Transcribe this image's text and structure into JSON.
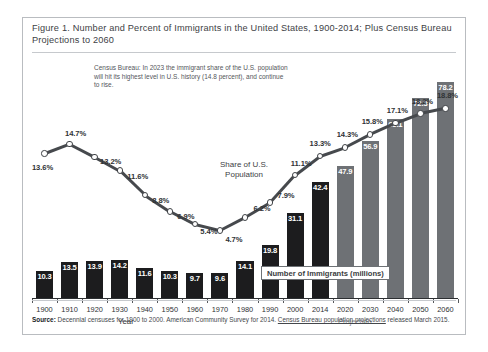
{
  "figure": {
    "title": "Figure 1. Number and Percent of Immigrants in the United States, 1900-2014; Plus Census Bureau Projections to 2060",
    "annotation": "Census Bureau: In 2023 the immigrant share of the U.S. population will hit its highest level in U.S. history (14.8 percent), and continue to rise.",
    "share_label": "Share of U.S. Population",
    "legend_label": "Number of Immigrants (millions)",
    "axis_title": "Year",
    "projection_title": "Projection",
    "source_prefix": "Source:",
    "source_text": " Decennial censuses for 1900 to 2000. American Community Survey for 2014. ",
    "source_link": "Census Bureau population projections",
    "source_suffix": " released March 2015."
  },
  "colors": {
    "historical_bar": "#1c1c1e",
    "projection_bar": "#6e7175",
    "line": "#46494d",
    "frame": "#b9bcc0"
  },
  "chart_data": {
    "type": "bar",
    "title": "Figure 1. Number and Percent of Immigrants in the United States, 1900-2014; Plus Census Bureau Projections to 2060",
    "xlabel": "Year",
    "ylabel": "Number of Immigrants (millions)",
    "ylim": [
      0,
      85
    ],
    "grid": false,
    "legend_position": "inside-bottom-right",
    "categories": [
      "1900",
      "1910",
      "1920",
      "1930",
      "1940",
      "1950",
      "1960",
      "1970",
      "1980",
      "1990",
      "2000",
      "2014",
      "2020",
      "2030",
      "2040",
      "2050",
      "2060"
    ],
    "projection_start": "2020",
    "series": [
      {
        "name": "Number of Immigrants (millions)",
        "type": "bar",
        "values": [
          10.3,
          13.5,
          13.9,
          14.2,
          11.6,
          10.3,
          9.7,
          9.6,
          14.1,
          19.8,
          31.1,
          42.4,
          47.9,
          56.9,
          65.1,
          72.3,
          78.2
        ],
        "labels": [
          "10.3",
          "13.5",
          "13.9",
          "14.2",
          "11.6",
          "10.3",
          "9.7",
          "9.6",
          "14.1",
          "19.8",
          "31.1",
          "42.4",
          "47.9",
          "56.9",
          "65.1",
          "72.3",
          "78.2"
        ]
      },
      {
        "name": "Share of U.S. Population",
        "type": "line",
        "values": [
          13.6,
          14.7,
          13.2,
          11.6,
          8.8,
          6.9,
          5.4,
          4.7,
          6.2,
          7.9,
          11.1,
          13.3,
          14.3,
          15.8,
          17.1,
          18.2,
          18.8
        ],
        "labels": [
          "13.6%",
          "14.7%",
          "13.2%",
          "11.6%",
          "8.8%",
          "6.9%",
          "5.4%",
          "4.7%",
          "6.2%",
          "7.9%",
          "11.1%",
          "13.3%",
          "14.3%",
          "15.8%",
          "17.1%",
          "18.2%",
          "18.8%"
        ],
        "ylim": [
          0,
          20
        ]
      }
    ],
    "annotations": [
      "Census Bureau: In 2023 the immigrant share of the U.S. population will hit its highest level in U.S. history (14.8 percent), and continue to rise."
    ]
  }
}
